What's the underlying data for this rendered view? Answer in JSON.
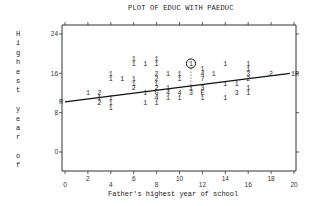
{
  "title": "PLOT OF EDUC WITH PAEDUC",
  "ylabel_chars": [
    "H",
    "i",
    "g",
    "h",
    "e",
    "s",
    "t",
    "",
    "y",
    "e",
    "a",
    "r",
    "",
    "o",
    "f"
  ],
  "xlabel": "Father's highest year of school",
  "chart_data": {
    "type": "scatter",
    "title": "PLOT OF EDUC WITH PAEDUC",
    "xlabel": "Father's highest year of school",
    "ylabel": "Highest year of school",
    "xlim": [
      0,
      20
    ],
    "ylim": [
      0,
      24
    ],
    "x_ticks_lower": [
      "0",
      "4",
      "8",
      "12",
      "16",
      "20"
    ],
    "x_ticks_upper": [
      "2",
      "6",
      "10",
      "14",
      "18"
    ],
    "y_ticks": [
      "0",
      "8",
      "16",
      "24"
    ],
    "grid": false,
    "regression_line": {
      "x": [
        0,
        20
      ],
      "y": [
        10.2,
        16.0
      ],
      "end_markers": [
        "R",
        "1R"
      ]
    },
    "highlighted_point": {
      "x": 11,
      "y": 18,
      "label": "1"
    },
    "points": [
      {
        "x": 2,
        "y": 12,
        "count": "1"
      },
      {
        "x": 3,
        "y": 12,
        "count": "2"
      },
      {
        "x": 3,
        "y": 11,
        "count": "1"
      },
      {
        "x": 3,
        "y": 10,
        "count": "2"
      },
      {
        "x": 4,
        "y": 16,
        "count": "1"
      },
      {
        "x": 4,
        "y": 15,
        "count": "1"
      },
      {
        "x": 4,
        "y": 11,
        "count": "1"
      },
      {
        "x": 4,
        "y": 10,
        "count": "1"
      },
      {
        "x": 4,
        "y": 9,
        "count": "1"
      },
      {
        "x": 5,
        "y": 15,
        "count": "1"
      },
      {
        "x": 6,
        "y": 19,
        "count": "1"
      },
      {
        "x": 6,
        "y": 18,
        "count": "1"
      },
      {
        "x": 6,
        "y": 15,
        "count": "1"
      },
      {
        "x": 6,
        "y": 14,
        "count": "1"
      },
      {
        "x": 6,
        "y": 13,
        "count": "2"
      },
      {
        "x": 7,
        "y": 18,
        "count": "1"
      },
      {
        "x": 7,
        "y": 12,
        "count": "1"
      },
      {
        "x": 7,
        "y": 10,
        "count": "1"
      },
      {
        "x": 8,
        "y": 19,
        "count": "1"
      },
      {
        "x": 8,
        "y": 18,
        "count": "1"
      },
      {
        "x": 8,
        "y": 16,
        "count": "2"
      },
      {
        "x": 8,
        "y": 15,
        "count": "2"
      },
      {
        "x": 8,
        "y": 14,
        "count": "1"
      },
      {
        "x": 8,
        "y": 13,
        "count": "2"
      },
      {
        "x": 8,
        "y": 12,
        "count": "G"
      },
      {
        "x": 8,
        "y": 11,
        "count": "4"
      },
      {
        "x": 8,
        "y": 10,
        "count": "1"
      },
      {
        "x": 9,
        "y": 16,
        "count": "1"
      },
      {
        "x": 9,
        "y": 13,
        "count": "1"
      },
      {
        "x": 9,
        "y": 12,
        "count": "4"
      },
      {
        "x": 9,
        "y": 11,
        "count": "1"
      },
      {
        "x": 10,
        "y": 16,
        "count": "1"
      },
      {
        "x": 10,
        "y": 15,
        "count": "1"
      },
      {
        "x": 10,
        "y": 12,
        "count": "4"
      },
      {
        "x": 10,
        "y": 11,
        "count": "1"
      },
      {
        "x": 11,
        "y": 13,
        "count": "1"
      },
      {
        "x": 11,
        "y": 12,
        "count": "3"
      },
      {
        "x": 12,
        "y": 17,
        "count": "1"
      },
      {
        "x": 12,
        "y": 16,
        "count": "4"
      },
      {
        "x": 12,
        "y": 15,
        "count": "7"
      },
      {
        "x": 12,
        "y": 13,
        "count": "3"
      },
      {
        "x": 12,
        "y": 12,
        "count": "E"
      },
      {
        "x": 12,
        "y": 11,
        "count": "1"
      },
      {
        "x": 13,
        "y": 16,
        "count": "1"
      },
      {
        "x": 14,
        "y": 18,
        "count": "1"
      },
      {
        "x": 14,
        "y": 14,
        "count": "1"
      },
      {
        "x": 14,
        "y": 11,
        "count": "1"
      },
      {
        "x": 15,
        "y": 14,
        "count": "1"
      },
      {
        "x": 15,
        "y": 12,
        "count": "3"
      },
      {
        "x": 16,
        "y": 18,
        "count": "1"
      },
      {
        "x": 16,
        "y": 17,
        "count": "1"
      },
      {
        "x": 16,
        "y": 16,
        "count": "3"
      },
      {
        "x": 16,
        "y": 15,
        "count": "2"
      },
      {
        "x": 16,
        "y": 13,
        "count": "1"
      },
      {
        "x": 16,
        "y": 12,
        "count": "1"
      },
      {
        "x": 18,
        "y": 16,
        "count": "2"
      }
    ]
  }
}
